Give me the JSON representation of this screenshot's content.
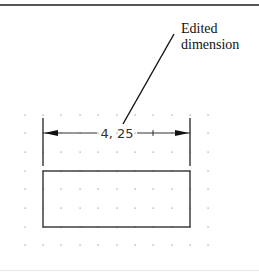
{
  "figure": {
    "callout": {
      "line1": "Edited",
      "line2": "dimension"
    },
    "dimension": {
      "value_text": "4, 25"
    },
    "grid": {
      "columns_x": [
        25,
        43,
        61,
        80,
        98,
        117,
        135,
        153,
        172,
        190,
        208
      ],
      "rows_y": [
        115,
        133,
        152,
        171,
        189,
        208,
        227,
        245
      ]
    },
    "rectangle": {
      "x1": 43,
      "y1": 171,
      "x2": 190,
      "y2": 227
    },
    "colors": {
      "line": "#222222",
      "grid_dot": "#999999",
      "text": "#111111"
    }
  }
}
